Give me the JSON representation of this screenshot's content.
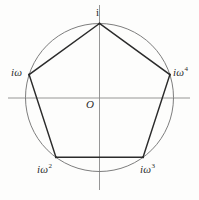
{
  "figure": {
    "background_color": "#fdfdfc",
    "axis_color": "#8a8a8a",
    "circle_color": "#6e6e6e",
    "pentagon_color": "#2b2b2b",
    "label_color": "#2b2b2b",
    "origin_label": "O",
    "vertex_labels": {
      "top": "i",
      "left": "iω",
      "right": "iω",
      "bottom_left": "iω",
      "bottom_right": "iω"
    },
    "exponents": {
      "top": "",
      "left": "",
      "right": "4",
      "bottom_left": "2",
      "bottom_right": "3"
    }
  },
  "chart_data": {
    "type": "scatter",
    "title": "",
    "subtitle": "",
    "xlabel": "",
    "ylabel": "",
    "grid": false,
    "legend": "none",
    "xlim": [
      -1.35,
      1.35
    ],
    "ylim": [
      -1.28,
      1.28
    ],
    "axes": {
      "origin_label": "O",
      "x_axis": {
        "from": [
          -1.24,
          0
        ],
        "to": [
          1.22,
          0
        ]
      },
      "y_axis": {
        "from": [
          0,
          -1.25
        ],
        "to": [
          0,
          1.25
        ]
      }
    },
    "circle": {
      "center": [
        0,
        0
      ],
      "radius": 1,
      "label": "unit circle"
    },
    "polygon": {
      "name": "regular pentagon",
      "sides": 5,
      "inscribed_in": "unit circle",
      "closed": true
    },
    "points": [
      {
        "label": "i",
        "angle_deg": 90,
        "x": 0.0,
        "y": 1.0
      },
      {
        "label": "iω",
        "angle_deg": 162,
        "x": -0.951,
        "y": 0.309
      },
      {
        "label": "iω^2",
        "angle_deg": 234,
        "x": -0.588,
        "y": -0.809
      },
      {
        "label": "iω^3",
        "angle_deg": 306,
        "x": 0.588,
        "y": -0.809
      },
      {
        "label": "iω^4",
        "angle_deg": 18,
        "x": 0.951,
        "y": 0.309
      }
    ],
    "annotations": [
      {
        "text": "i",
        "x": 0.0,
        "y": 1.0,
        "placement": "above"
      },
      {
        "text": "iω",
        "x": -0.951,
        "y": 0.309,
        "placement": "left"
      },
      {
        "text": "iω^4",
        "x": 0.951,
        "y": 0.309,
        "placement": "right"
      },
      {
        "text": "iω^2",
        "x": -0.588,
        "y": -0.809,
        "placement": "below-left"
      },
      {
        "text": "iω^3",
        "x": 0.588,
        "y": -0.809,
        "placement": "below-right"
      },
      {
        "text": "O",
        "x": 0.0,
        "y": 0.0,
        "placement": "below-left"
      }
    ]
  }
}
